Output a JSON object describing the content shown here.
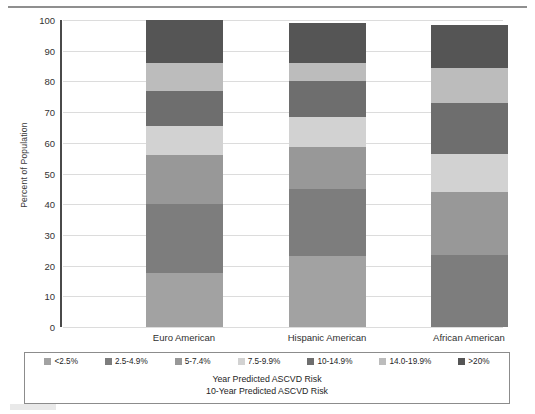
{
  "chart_data": {
    "type": "bar",
    "subtype": "stacked-bar-100",
    "title": "",
    "xlabel": "",
    "ylabel": "Percent of Population",
    "ylim": [
      0,
      100
    ],
    "yticks": [
      0,
      10,
      20,
      30,
      40,
      50,
      60,
      70,
      80,
      90,
      100
    ],
    "grid": true,
    "legend_position": "bottom",
    "categories": [
      "Euro American",
      "Hispanic American",
      "African American"
    ],
    "series": [
      {
        "name": "<2.5%",
        "color": "#a2a2a2",
        "values": [
          17.5,
          23.0,
          0.0
        ]
      },
      {
        "name": "2.5-4.9%",
        "color": "#7d7d7d",
        "values": [
          22.5,
          22.0,
          23.5
        ]
      },
      {
        "name": "5-7.4%",
        "color": "#989898",
        "values": [
          16.0,
          13.5,
          20.5
        ]
      },
      {
        "name": "7.5-9.9%",
        "color": "#d2d2d2",
        "values": [
          9.5,
          10.0,
          12.5
        ]
      },
      {
        "name": "10-14.9%",
        "color": "#6e6e6e",
        "values": [
          11.5,
          11.5,
          16.5
        ]
      },
      {
        "name": "14.0-19.9%",
        "color": "#bcbcbc",
        "values": [
          9.0,
          6.0,
          11.5
        ]
      },
      {
        "name": ">20%",
        "color": "#555555",
        "values": [
          14.0,
          13.0,
          14.0
        ]
      }
    ],
    "segment_boundaries": {
      "Euro American": [
        0,
        17.5,
        40.0,
        56.0,
        65.5,
        77.0,
        86.0,
        100.0
      ],
      "Hispanic American": [
        0,
        23.0,
        45.0,
        58.5,
        68.5,
        80.0,
        86.0,
        99.0
      ],
      "African American": [
        0,
        0.0,
        23.5,
        44.0,
        56.5,
        73.0,
        84.5,
        98.5
      ]
    },
    "annotations": [
      "Year Predicted ASCVD Risk",
      "10-Year Predicted ASCVD Risk"
    ]
  },
  "axis": {
    "y_title": "Percent of Population",
    "y_ticks": [
      "0",
      "10",
      "20",
      "30",
      "40",
      "50",
      "60",
      "70",
      "80",
      "90",
      "100"
    ]
  },
  "legend": {
    "items": [
      {
        "label": "<2.5%"
      },
      {
        "label": "2.5-4.9%"
      },
      {
        "label": "5-7.4%"
      },
      {
        "label": "7.5-9.9%"
      },
      {
        "label": "10-14.9%"
      },
      {
        "label": "14.0-19.9%"
      },
      {
        "label": ">20%"
      }
    ],
    "caption_line_1": "Year Predicted ASCVD Risk",
    "caption_line_2": "10-Year Predicted ASCVD Risk"
  }
}
